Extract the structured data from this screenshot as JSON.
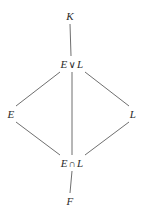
{
  "diagram": {
    "type": "hasse-lattice-diagram",
    "background_color": "#ffffff",
    "edge_color": "#6f6f6f",
    "text_color": "#2b2b2b",
    "nodes": [
      {
        "id": "K",
        "label": "K",
        "x": 70,
        "y": 16
      },
      {
        "id": "EvL",
        "label": "E ∨ L",
        "left": "E",
        "op": "∨",
        "right": "L",
        "x": 72,
        "y": 64
      },
      {
        "id": "E",
        "label": "E",
        "x": 11,
        "y": 114
      },
      {
        "id": "L",
        "label": "L",
        "x": 133,
        "y": 114
      },
      {
        "id": "EnL",
        "label": "E ∩ L",
        "left": "E",
        "op": "∩",
        "right": "L",
        "x": 72,
        "y": 163
      },
      {
        "id": "F",
        "label": "F",
        "x": 70,
        "y": 201
      }
    ],
    "edges": [
      {
        "from": "K",
        "to": "EvL",
        "x1": 70,
        "y1": 24,
        "x2": 71,
        "y2": 56
      },
      {
        "from": "EvL",
        "to": "E",
        "x1": 60,
        "y1": 72,
        "x2": 16,
        "y2": 106
      },
      {
        "from": "EvL",
        "to": "L",
        "x1": 85,
        "y1": 72,
        "x2": 129,
        "y2": 106
      },
      {
        "from": "EvL",
        "to": "EnL",
        "x1": 72,
        "y1": 72,
        "x2": 72,
        "y2": 155
      },
      {
        "from": "E",
        "to": "EnL",
        "x1": 16,
        "y1": 122,
        "x2": 60,
        "y2": 155
      },
      {
        "from": "L",
        "to": "EnL",
        "x1": 129,
        "y1": 122,
        "x2": 85,
        "y2": 155
      },
      {
        "from": "EnL",
        "to": "F",
        "x1": 72,
        "y1": 171,
        "x2": 70,
        "y2": 193
      }
    ]
  }
}
